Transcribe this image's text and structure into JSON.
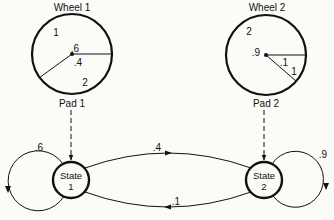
{
  "diagram": {
    "wheels": [
      {
        "title": "Wheel 1",
        "pad_label": "Pad 1",
        "sector_labels": {
          "big_number": "1",
          "big_prob": ".6",
          "small_prob": ".4",
          "small_number": "2"
        }
      },
      {
        "title": "Wheel 2",
        "pad_label": "Pad 2",
        "sector_labels": {
          "big_number": "2",
          "big_prob": ".9",
          "small_prob": ".1",
          "small_number": "1"
        }
      }
    ],
    "states": [
      {
        "name": "State",
        "number": "1"
      },
      {
        "name": "State",
        "number": "2"
      }
    ],
    "transitions": {
      "self_1": ".6",
      "one_to_two": ".4",
      "two_to_one": ".1",
      "self_2": ".9"
    },
    "colors": {
      "ink": "#111111",
      "background": "#fbfbf8"
    }
  }
}
